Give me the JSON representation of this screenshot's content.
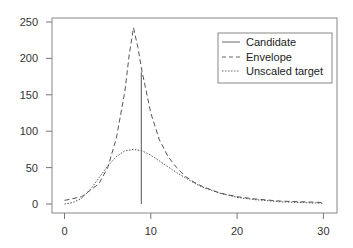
{
  "chart_data": {
    "type": "line",
    "title": "",
    "xlabel": "",
    "ylabel": "",
    "xlim": [
      -1,
      31
    ],
    "ylim": [
      -10,
      262
    ],
    "x_ticks": [
      "0",
      "10",
      "20",
      "30"
    ],
    "y_ticks": [
      "0",
      "50",
      "100",
      "150",
      "200",
      "250"
    ],
    "grid": false,
    "legend_position": "top-right",
    "legend": [
      "Candidate",
      "Envelope",
      "Unscaled target"
    ],
    "series": [
      {
        "name": "Candidate",
        "style": "solid",
        "kind": "vertical-line",
        "x": [
          8.9,
          8.9
        ],
        "y": [
          0,
          181
        ]
      },
      {
        "name": "Envelope",
        "style": "dashed",
        "x": [
          0,
          2,
          4,
          5,
          6,
          7,
          7.5,
          8,
          8.5,
          9,
          10,
          11,
          12,
          13,
          14,
          15,
          16,
          18,
          20,
          22,
          25,
          30
        ],
        "y": [
          5,
          10,
          28,
          50,
          90,
          155,
          205,
          242,
          215,
          181,
          125,
          88,
          65,
          50,
          38,
          30,
          24,
          15,
          10,
          7,
          4,
          2
        ]
      },
      {
        "name": "Unscaled target",
        "style": "dotted",
        "x": [
          0,
          1,
          2,
          3,
          4,
          5,
          6,
          7,
          8,
          9,
          10,
          11,
          12,
          13,
          14,
          15,
          16,
          18,
          20,
          22,
          25,
          30
        ],
        "y": [
          0,
          2,
          8,
          20,
          36,
          52,
          65,
          73,
          75,
          73,
          67,
          59,
          51,
          43,
          36,
          29,
          23,
          15,
          9,
          6,
          3,
          1
        ]
      }
    ]
  },
  "axes": {
    "x_ticks": [
      {
        "label": "0",
        "value": 0
      },
      {
        "label": "10",
        "value": 10
      },
      {
        "label": "20",
        "value": 20
      },
      {
        "label": "30",
        "value": 30
      }
    ],
    "y_ticks": [
      {
        "label": "0",
        "value": 0
      },
      {
        "label": "50",
        "value": 50
      },
      {
        "label": "100",
        "value": 100
      },
      {
        "label": "150",
        "value": 150
      },
      {
        "label": "200",
        "value": 200
      },
      {
        "label": "250",
        "value": 250
      }
    ]
  },
  "legend": {
    "items": [
      {
        "label": "Candidate",
        "style": "solid"
      },
      {
        "label": "Envelope",
        "style": "dashed"
      },
      {
        "label": "Unscaled target",
        "style": "dotted"
      }
    ]
  },
  "colors": {
    "line": "#555555",
    "axis": "#777777",
    "text": "#333333"
  }
}
